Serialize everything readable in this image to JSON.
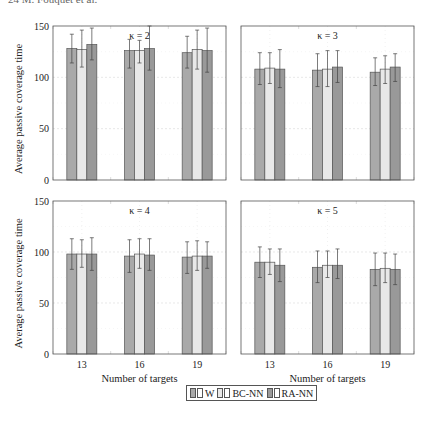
{
  "page": {
    "header_fragment": "24        M. Fouquet et al."
  },
  "chart_data": [
    {
      "type": "bar",
      "title": "κ = 2",
      "xlabel": "",
      "ylabel": "Average passive coverage time",
      "categories": [
        "13",
        "16",
        "19"
      ],
      "ylim": [
        0,
        150
      ],
      "yticks": [
        0,
        50,
        100,
        150
      ],
      "grid": true,
      "series": [
        {
          "name": "W",
          "values": [
            128,
            126,
            124
          ],
          "err_low": [
            114,
            109,
            109
          ],
          "err_high": [
            142,
            137,
            140
          ]
        },
        {
          "name": "BC-NN",
          "values": [
            127,
            126,
            127
          ],
          "err_low": [
            110,
            114,
            108
          ],
          "err_high": [
            146,
            136,
            146
          ]
        },
        {
          "name": "RA-NN",
          "values": [
            132,
            128,
            126
          ],
          "err_low": [
            117,
            107,
            105
          ],
          "err_high": [
            148,
            150,
            148
          ]
        }
      ]
    },
    {
      "type": "bar",
      "title": "κ = 3",
      "xlabel": "",
      "ylabel": "",
      "categories": [
        "13",
        "16",
        "19"
      ],
      "ylim": [
        0,
        150
      ],
      "yticks": [
        0,
        50,
        100,
        150
      ],
      "grid": true,
      "series": [
        {
          "name": "W",
          "values": [
            108,
            107,
            105
          ],
          "err_low": [
            93,
            91,
            92
          ],
          "err_high": [
            124,
            123,
            119
          ]
        },
        {
          "name": "BC-NN",
          "values": [
            109,
            108,
            108
          ],
          "err_low": [
            94,
            91,
            94
          ],
          "err_high": [
            124,
            126,
            121
          ]
        },
        {
          "name": "RA-NN",
          "values": [
            108,
            110,
            110
          ],
          "err_low": [
            90,
            95,
            96
          ],
          "err_high": [
            127,
            126,
            123
          ]
        }
      ]
    },
    {
      "type": "bar",
      "title": "κ = 4",
      "xlabel": "Number of targets",
      "ylabel": "Average passive coverage time",
      "categories": [
        "13",
        "16",
        "19"
      ],
      "ylim": [
        0,
        150
      ],
      "yticks": [
        0,
        50,
        100,
        150
      ],
      "grid": true,
      "series": [
        {
          "name": "W",
          "values": [
            98,
            96,
            95
          ],
          "err_low": [
            83,
            80,
            79
          ],
          "err_high": [
            113,
            112,
            110
          ]
        },
        {
          "name": "BC-NN",
          "values": [
            98,
            98,
            96
          ],
          "err_low": [
            85,
            84,
            82
          ],
          "err_high": [
            112,
            113,
            111
          ]
        },
        {
          "name": "RA-NN",
          "values": [
            98,
            97,
            96
          ],
          "err_low": [
            82,
            82,
            84
          ],
          "err_high": [
            114,
            113,
            110
          ]
        }
      ]
    },
    {
      "type": "bar",
      "title": "κ = 5",
      "xlabel": "Number of targets",
      "ylabel": "",
      "categories": [
        "13",
        "16",
        "19"
      ],
      "ylim": [
        0,
        150
      ],
      "yticks": [
        0,
        50,
        100,
        150
      ],
      "grid": true,
      "series": [
        {
          "name": "W",
          "values": [
            90,
            85,
            83
          ],
          "err_low": [
            75,
            70,
            67
          ],
          "err_high": [
            105,
            101,
            99
          ]
        },
        {
          "name": "BC-NN",
          "values": [
            90,
            87,
            84
          ],
          "err_low": [
            78,
            75,
            70
          ],
          "err_high": [
            103,
            101,
            99
          ]
        },
        {
          "name": "RA-NN",
          "values": [
            87,
            87,
            83
          ],
          "err_low": [
            71,
            74,
            68
          ],
          "err_high": [
            103,
            103,
            98
          ]
        }
      ]
    }
  ],
  "legend": {
    "position": "bottom-center",
    "items": [
      {
        "label": "W",
        "color": "#a9a9a9"
      },
      {
        "label": "BC-NN",
        "color": "#e8e8e8"
      },
      {
        "label": "RA-NN",
        "color": "#999999"
      }
    ]
  }
}
